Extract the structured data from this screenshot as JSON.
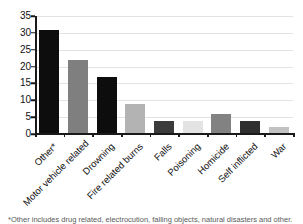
{
  "chart_data": {
    "type": "bar",
    "title": "",
    "subtitle": "",
    "xlabel": "",
    "ylabel": "",
    "ylim": [
      0,
      35
    ],
    "ytick_step": 5,
    "yticks": [
      0,
      5,
      10,
      15,
      20,
      25,
      30,
      35
    ],
    "grid": true,
    "grid_axis": "y",
    "legend": false,
    "legend_position": "none",
    "categories": [
      "Other*",
      "Motor vehicle related",
      "Drowning",
      "Fire related burns",
      "Falls",
      "Poisoning",
      "Homicide",
      "Self inflicted",
      "War"
    ],
    "values": [
      31,
      22,
      17,
      9,
      4,
      4,
      6,
      4,
      2
    ],
    "bar_colors": [
      "#0d0d0d",
      "#7f7f7f",
      "#0d0d0d",
      "#b3b3b3",
      "#3b3b3b",
      "#e3e3e3",
      "#828282",
      "#2f2f2f",
      "#c2c2c2"
    ],
    "annotations": []
  },
  "axes": {
    "y_tick_labels": [
      "0",
      "5",
      "10",
      "15",
      "20",
      "25",
      "30",
      "35"
    ]
  },
  "caption": {
    "text": "*Other includes drug related, electrocution, falling objects, natural disasters and other."
  },
  "colors": {
    "axis": "#1a1a1a",
    "gridline": "#e2e2e2",
    "text": "#111111",
    "background": "#ffffff"
  }
}
